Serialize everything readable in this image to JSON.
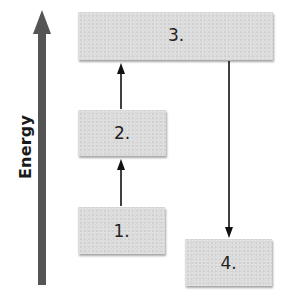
{
  "diagram": {
    "axis": {
      "label": "Energy",
      "direction": "up",
      "color": "#555555"
    },
    "boxes": [
      {
        "id": "1",
        "label": "1."
      },
      {
        "id": "2",
        "label": "2."
      },
      {
        "id": "3",
        "label": "3."
      },
      {
        "id": "4",
        "label": "4."
      }
    ],
    "arrows": [
      {
        "from": "1",
        "to": "2",
        "direction": "up"
      },
      {
        "from": "2",
        "to": "3",
        "direction": "up"
      },
      {
        "from": "3",
        "to": "4",
        "direction": "down"
      }
    ],
    "colors": {
      "box_fill": "#dcdcdc",
      "arrow": "#111111",
      "text": "#222222"
    }
  }
}
